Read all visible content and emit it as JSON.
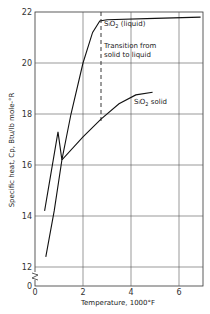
{
  "chart_data": {
    "type": "line",
    "title": "",
    "xlabel": "Temperature, 1000°F",
    "ylabel": "Specific heat, Cp, Btu/lb mole-°R",
    "xlim": [
      0,
      7
    ],
    "ylim": [
      12,
      22
    ],
    "y_axis_break": true,
    "y_origin_label": "0",
    "x_ticks": [
      "0",
      "2",
      "4",
      "6"
    ],
    "y_ticks": [
      "12",
      "14",
      "16",
      "18",
      "20",
      "22"
    ],
    "grid": true,
    "series": [
      {
        "name": "SiO2 (liquid)",
        "points": [
          {
            "x": 0.4,
            "y": 14.2
          },
          {
            "x": 0.96,
            "y": 17.3
          },
          {
            "x": 1.12,
            "y": 16.2
          },
          {
            "x": 1.5,
            "y": 18.0
          },
          {
            "x": 2.0,
            "y": 20.0
          },
          {
            "x": 2.4,
            "y": 21.2
          },
          {
            "x": 2.7,
            "y": 21.65
          },
          {
            "x": 3.0,
            "y": 21.7
          },
          {
            "x": 5.0,
            "y": 21.75
          },
          {
            "x": 6.9,
            "y": 21.8
          }
        ]
      },
      {
        "name": "SiO2 solid",
        "points": [
          {
            "x": 0.45,
            "y": 12.4
          },
          {
            "x": 0.8,
            "y": 14.2
          },
          {
            "x": 1.12,
            "y": 16.2
          },
          {
            "x": 2.0,
            "y": 17.1
          },
          {
            "x": 2.75,
            "y": 17.8
          },
          {
            "x": 3.5,
            "y": 18.4
          },
          {
            "x": 4.2,
            "y": 18.75
          },
          {
            "x": 4.9,
            "y": 18.85
          }
        ]
      }
    ],
    "annotations": [
      {
        "text": "Transition from solid to liquid",
        "type": "vertical-dashed-line",
        "x": 2.75
      },
      {
        "text": "SiO2 (liquid)",
        "x": 3.2,
        "y": 21.4
      },
      {
        "text": "SiO2 solid",
        "x": 3.8,
        "y": 18.2
      }
    ],
    "legend": null
  },
  "labels": {
    "xlabel": "Temperature, 1000°F",
    "ylabel": "Specific heat, Cp, Btu/lb mole-°R",
    "transition_line1": "Transition from",
    "transition_line2": "solid to liquid",
    "liquid": "SiO2 (liquid)",
    "solid": "SiO2 solid",
    "origin": "0"
  },
  "ticks": {
    "x": [
      "0",
      "2",
      "4",
      "6"
    ],
    "y": [
      "12",
      "14",
      "16",
      "18",
      "20",
      "22"
    ]
  }
}
